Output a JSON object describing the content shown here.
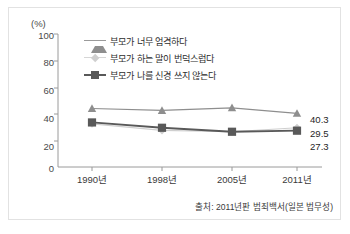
{
  "chart_data": {
    "type": "line",
    "title": "",
    "subtitle": "",
    "xlabel": "",
    "ylabel": "(%)",
    "ylim": [
      0,
      100
    ],
    "yticks": [
      0,
      20,
      40,
      60,
      80,
      100
    ],
    "ytick_labels": [
      "0",
      "20",
      "40",
      "60",
      "80",
      "100"
    ],
    "categories": [
      "1990년",
      "1998년",
      "2005년",
      "2011년"
    ],
    "grid": false,
    "legend_position": "top-left-inside",
    "series": [
      {
        "name": "부모가 너무 엄격하다",
        "marker": "triangle",
        "color": "#8e8e8e",
        "values": [
          44.0,
          42.5,
          44.5,
          40.3
        ],
        "end_label": "40.3"
      },
      {
        "name": "부모가 하는 말이 번덕스럽다",
        "marker": "diamond",
        "color": "#cfcfcf",
        "values": [
          32.5,
          27.5,
          26.5,
          29.5
        ],
        "end_label": "29.5"
      },
      {
        "name": "부모가 나를 신경 쓰지 않는다",
        "marker": "square",
        "color": "#595959",
        "values": [
          33.5,
          29.5,
          26.5,
          27.3
        ],
        "end_label": "27.3"
      }
    ],
    "annotations": {
      "source": "출처: 2011년판 범죄백서(일본 법무성)"
    }
  },
  "axis": {
    "unit_label": "(%)",
    "y_tick_labels": [
      "100",
      "80",
      "60",
      "40",
      "20",
      "0"
    ],
    "x_tick_labels": [
      "1990년",
      "1998년",
      "2005년",
      "2011년"
    ]
  },
  "legend": {
    "items": [
      {
        "label": "부모가 너무 엄격하다",
        "color": "#8e8e8e",
        "marker": "triangle-marker"
      },
      {
        "label": "부모가 하는 말이 번덕스럽다",
        "color": "#cfcfcf",
        "marker": "diamond-marker"
      },
      {
        "label": "부모가 나를 신경 쓰지 않는다",
        "color": "#595959",
        "marker": "square-marker"
      }
    ]
  },
  "end_labels": [
    "40.3",
    "29.5",
    "27.3"
  ],
  "source": "출처: 2011년판 범죄백서(일본 법무성)",
  "colors": {
    "series_strict": "#8e8e8e",
    "series_fickle": "#cfcfcf",
    "series_neglect": "#595959",
    "axis": "#8a8a8a",
    "border": "#e2e2e2",
    "text": "#3a3a3a"
  }
}
